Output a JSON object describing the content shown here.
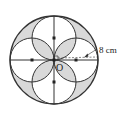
{
  "diagram": {
    "center_label": "O",
    "radius_label": "8 cm",
    "colors": {
      "stroke": "#333333",
      "shade": "#d9d9d9",
      "background": "#ffffff"
    },
    "big_circle": {
      "cx": 54,
      "cy": 60,
      "r": 44
    },
    "small_circles": [
      {
        "cx": 54,
        "cy": 38,
        "r": 22
      },
      {
        "cx": 54,
        "cy": 82,
        "r": 22
      },
      {
        "cx": 32,
        "cy": 60,
        "r": 22
      },
      {
        "cx": 76,
        "cy": 60,
        "r": 22
      }
    ]
  }
}
